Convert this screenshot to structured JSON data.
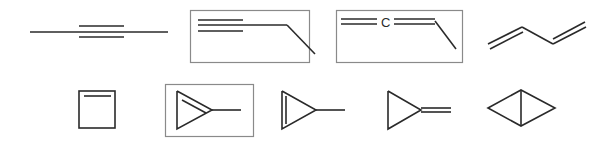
{
  "diagram": {
    "rows": [
      {
        "molecules": [
          {
            "id": "2-butyne",
            "highlighted": false
          },
          {
            "id": "1-butyne",
            "highlighted": true
          },
          {
            "id": "1,2-butadiene",
            "highlighted": true,
            "atom_label": "C"
          },
          {
            "id": "1,3-butadiene",
            "highlighted": false
          }
        ]
      },
      {
        "molecules": [
          {
            "id": "cyclobutene",
            "highlighted": false
          },
          {
            "id": "1-methylcyclopropene",
            "highlighted": true
          },
          {
            "id": "3-methylcyclopropene",
            "highlighted": false
          },
          {
            "id": "methylenecyclopropane",
            "highlighted": false
          },
          {
            "id": "bicyclo[1.1.0]butane",
            "highlighted": false
          }
        ]
      }
    ],
    "colors": {
      "bond": "#2a2a2a",
      "highlight_box": "#8a8a8a",
      "background": "#ffffff"
    }
  }
}
